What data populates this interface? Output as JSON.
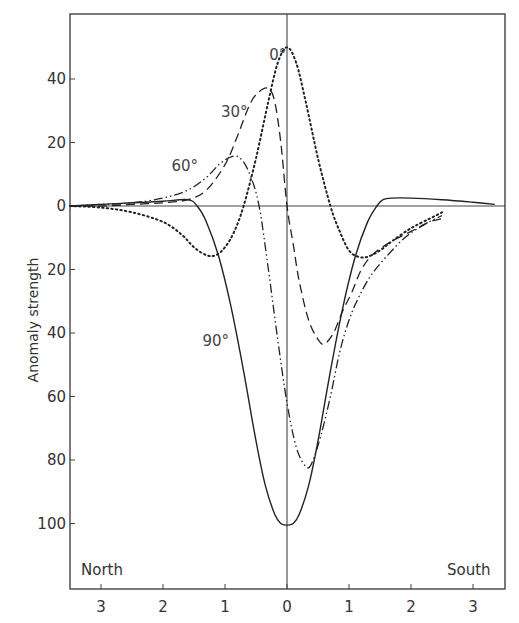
{
  "chart_data": {
    "type": "line",
    "title": "",
    "xlabel": "",
    "ylabel": "Anomaly strength",
    "x_direction_labels": {
      "left": "North",
      "right": "South"
    },
    "x_ticks": [
      {
        "value": -3,
        "label": "3"
      },
      {
        "value": -2,
        "label": "2"
      },
      {
        "value": -1,
        "label": "1"
      },
      {
        "value": 0,
        "label": "0"
      },
      {
        "value": 1,
        "label": "1"
      },
      {
        "value": 2,
        "label": "2"
      },
      {
        "value": 3,
        "label": "3"
      }
    ],
    "y_ticks": [
      {
        "value": 40,
        "label": "40"
      },
      {
        "value": 20,
        "label": "20"
      },
      {
        "value": 0,
        "label": "0"
      },
      {
        "value": -20,
        "label": "20"
      },
      {
        "value": -40,
        "label": "40"
      },
      {
        "value": -60,
        "label": "60"
      },
      {
        "value": -80,
        "label": "80"
      },
      {
        "value": -100,
        "label": "100"
      }
    ],
    "xlim": [
      -3.5,
      3.5
    ],
    "ylim": [
      -118,
      63
    ],
    "grid": false,
    "legend": "inline labels on curves",
    "series": [
      {
        "name": "0°",
        "style": "dotted",
        "label_pos": [
          -0.15,
          46
        ],
        "x": [
          -3.5,
          -3.0,
          -2.5,
          -2.0,
          -1.7,
          -1.5,
          -1.3,
          -1.15,
          -1.0,
          -0.85,
          -0.7,
          -0.5,
          -0.3,
          -0.15,
          0.0,
          0.15,
          0.3,
          0.5,
          0.7,
          0.85,
          1.0,
          1.15,
          1.3,
          1.5,
          1.7,
          2.0,
          2.3,
          2.5
        ],
        "y": [
          0,
          -0.5,
          -2,
          -5,
          -9,
          -13,
          -15.5,
          -15.5,
          -13,
          -8,
          0,
          15,
          33,
          45,
          50,
          45,
          33,
          15,
          0,
          -8,
          -14,
          -16,
          -16,
          -14,
          -11,
          -7,
          -4,
          -2
        ]
      },
      {
        "name": "30°",
        "style": "dashed",
        "label_pos": [
          -0.85,
          28
        ],
        "x": [
          -3.5,
          -3.0,
          -2.5,
          -2.0,
          -1.6,
          -1.3,
          -1.0,
          -0.8,
          -0.6,
          -0.45,
          -0.3,
          -0.2,
          -0.1,
          0.0,
          0.1,
          0.2,
          0.35,
          0.5,
          0.6,
          0.75,
          0.9,
          1.05,
          1.2,
          1.4,
          1.7,
          2.0,
          2.3,
          2.5
        ],
        "y": [
          0,
          0,
          0.5,
          1,
          2,
          5,
          13,
          22,
          32,
          36,
          37,
          33,
          20,
          0,
          -12,
          -24,
          -36,
          -42,
          -43.5,
          -40,
          -33,
          -27,
          -20,
          -15,
          -11,
          -8,
          -5,
          -4
        ]
      },
      {
        "name": "60°",
        "style": "dash-dot",
        "label_pos": [
          -1.65,
          11
        ],
        "x": [
          -3.5,
          -3.0,
          -2.5,
          -2.0,
          -1.6,
          -1.3,
          -1.1,
          -0.9,
          -0.75,
          -0.6,
          -0.45,
          -0.3,
          -0.15,
          0.0,
          0.15,
          0.3,
          0.4,
          0.55,
          0.7,
          0.85,
          1.0,
          1.15,
          1.35,
          1.6,
          1.9,
          2.2,
          2.5
        ],
        "y": [
          0,
          0.5,
          1,
          2.5,
          5,
          9,
          13,
          15.5,
          15,
          10,
          0,
          -20,
          -42,
          -62,
          -76,
          -82,
          -81,
          -72,
          -60,
          -46,
          -36,
          -29,
          -22,
          -16,
          -10,
          -6,
          -3
        ]
      },
      {
        "name": "90°",
        "style": "solid",
        "label_pos": [
          -1.15,
          -44
        ],
        "x": [
          -3.5,
          -3.0,
          -2.5,
          -2.0,
          -1.6,
          -1.45,
          -1.3,
          -1.1,
          -0.9,
          -0.7,
          -0.5,
          -0.35,
          -0.2,
          -0.1,
          0.0,
          0.1,
          0.2,
          0.35,
          0.5,
          0.7,
          0.9,
          1.1,
          1.3,
          1.45,
          1.55,
          1.7,
          2.0,
          2.5,
          3.0,
          3.35
        ],
        "y": [
          0,
          0.5,
          1,
          1.5,
          2,
          0,
          -5,
          -16,
          -32,
          -52,
          -74,
          -88,
          -97,
          -100,
          -100.5,
          -100,
          -97,
          -88,
          -74,
          -52,
          -32,
          -16,
          -5,
          0,
          2,
          2.5,
          2.5,
          2,
          1.2,
          0.5
        ]
      }
    ]
  }
}
